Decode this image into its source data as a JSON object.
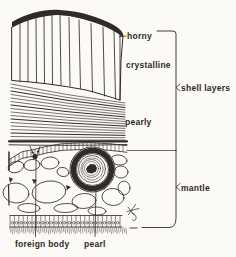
{
  "figure": {
    "labels": {
      "horny": "horny",
      "crystalline": "crystalline",
      "pearly": "pearly",
      "shell_layers": "shell layers",
      "mantle": "mantle",
      "foreign_body": "foreign body",
      "pearl": "pearl"
    },
    "colors": {
      "ink": "#2f2b27",
      "paper": "#fbfaf6",
      "hatch": "#7d7a74"
    }
  }
}
